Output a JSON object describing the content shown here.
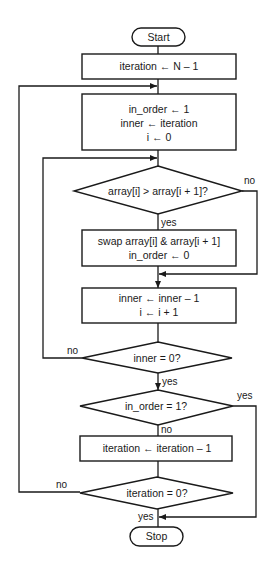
{
  "flowchart": {
    "start": {
      "label": "Start"
    },
    "stop": {
      "label": "Stop"
    },
    "init_iteration": {
      "lines": [
        "iteration ← N – 1"
      ]
    },
    "init_pass": {
      "lines": [
        "in_order  ← 1",
        "inner ← iteration",
        "i ← 0"
      ]
    },
    "compare": {
      "text": "array[i] > array[i + 1]?",
      "yes": "yes",
      "no": "no"
    },
    "swap": {
      "lines": [
        "swap array[i] & array[i + 1]",
        "in_order  ← 0"
      ]
    },
    "advance": {
      "lines": [
        "inner ← inner – 1",
        "i  ← i + 1"
      ]
    },
    "inner_done": {
      "text": "inner = 0?",
      "yes": "yes",
      "no": "no"
    },
    "in_order_check": {
      "text": "in_order = 1?",
      "yes": "yes",
      "no": "no"
    },
    "decrement": {
      "lines": [
        "iteration ← iteration – 1"
      ]
    },
    "iteration_done": {
      "text": "iteration = 0?",
      "yes": "yes",
      "no": "no"
    }
  },
  "colors": {
    "stroke": "#1a1a1a",
    "background": "#ffffff"
  }
}
